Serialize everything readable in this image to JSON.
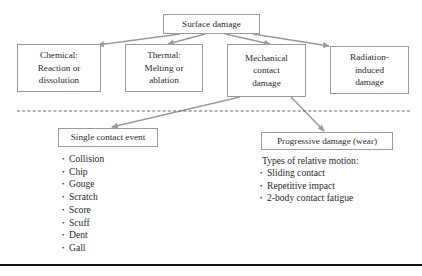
{
  "diagram": {
    "root": {
      "id": "surface",
      "label": "Surface damage"
    },
    "level1": [
      {
        "id": "chemical",
        "label": "Chemical:\nReaction or\ndissolution"
      },
      {
        "id": "thermal",
        "label": "Thermal:\nMelting or\nablation"
      },
      {
        "id": "mechanical",
        "label": "Mechanical\ncontact\ndamage"
      },
      {
        "id": "radiation",
        "label": "Radiation-\ninduced\ndamage"
      }
    ],
    "level2": [
      {
        "id": "single",
        "label": "Single contact event"
      },
      {
        "id": "progressive",
        "label": "Progressive damage (wear)"
      }
    ],
    "single_items": [
      "Collision",
      "Chip",
      "Gouge",
      "Scratch",
      "Score",
      "Scuff",
      "Dent",
      "Gall"
    ],
    "progressive_caption": "Types of relative motion:",
    "progressive_items": [
      "Sliding contact",
      "Repetitive impact",
      "2-body contact fatigue"
    ],
    "edges": [
      {
        "from": "surface",
        "to": "chemical"
      },
      {
        "from": "surface",
        "to": "thermal"
      },
      {
        "from": "surface",
        "to": "mechanical"
      },
      {
        "from": "surface",
        "to": "radiation"
      },
      {
        "from": "mechanical",
        "to": "single"
      },
      {
        "from": "mechanical",
        "to": "progressive"
      }
    ],
    "colors": {
      "arrow": "#9b9b9b",
      "box_border": "#9a9a9a",
      "dashed": "#555555",
      "rule": "#111111"
    }
  }
}
